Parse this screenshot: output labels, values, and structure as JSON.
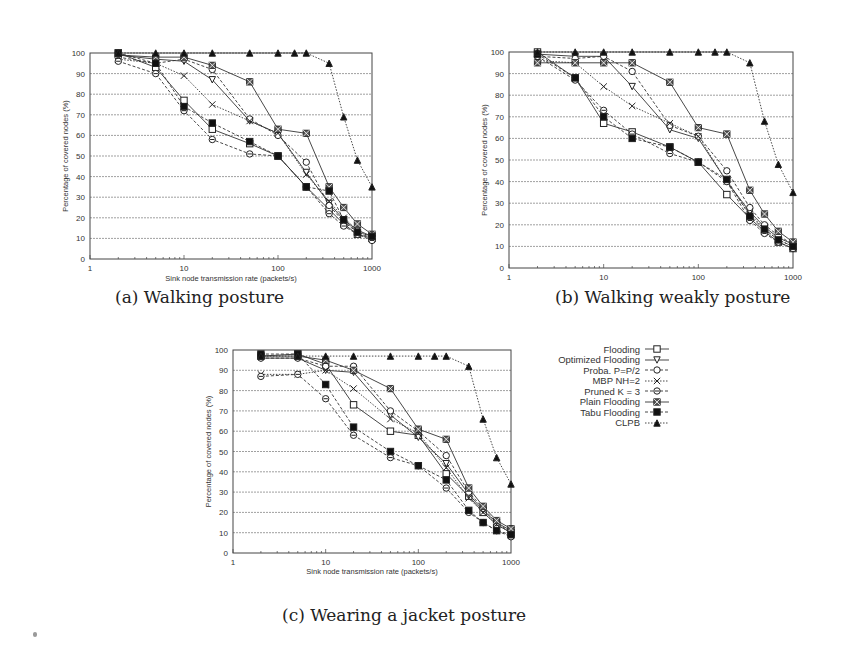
{
  "figure": {
    "captions": {
      "a": "(a) Walking posture",
      "b": "(b) Walking weakly posture",
      "c": "(c) Wearing a jacket posture"
    },
    "legend": [
      {
        "label": "Flooding",
        "marker": "square-open",
        "line": "solid"
      },
      {
        "label": "Optimized Flooding",
        "marker": "triangle-down-open",
        "line": "solid"
      },
      {
        "label": "Proba. P=P/2",
        "marker": "circle-open",
        "line": "dashed"
      },
      {
        "label": "MBP NH=2",
        "marker": "x",
        "line": "dotted"
      },
      {
        "label": "Pruned K = 3",
        "marker": "circle-open-dot",
        "line": "dashed"
      },
      {
        "label": "Plain Flooding",
        "marker": "star-box",
        "line": "solid"
      },
      {
        "label": "Tabu Flooding",
        "marker": "square-filled",
        "line": "dashed"
      },
      {
        "label": "CLPB",
        "marker": "triangle-filled",
        "line": "dotted"
      }
    ]
  },
  "chart_data": [
    {
      "id": "a",
      "type": "line",
      "title": "(a) Walking posture",
      "xlabel": "Sink node transmission rate (packets/s)",
      "ylabel": "Percentage of covered nodes (%)",
      "xscale": "log",
      "xlim": [
        1,
        1000
      ],
      "ylim": [
        0,
        100
      ],
      "xticks": [
        "1",
        "10",
        "100",
        "1000"
      ],
      "yticks": [
        "0",
        "10",
        "20",
        "30",
        "40",
        "50",
        "60",
        "70",
        "80",
        "90",
        "100"
      ],
      "grid": "horizontal",
      "x": [
        2,
        5,
        10,
        20,
        50,
        100,
        200,
        350,
        500,
        700,
        1000
      ],
      "series": [
        {
          "name": "Flooding",
          "values": [
            100,
            93,
            77,
            63,
            56,
            50,
            35,
            24,
            17,
            12,
            10
          ]
        },
        {
          "name": "Optimized Flooding",
          "values": [
            99,
            97,
            96,
            87,
            67,
            61,
            42,
            27,
            19,
            14,
            11
          ]
        },
        {
          "name": "Proba. P=P/2",
          "values": [
            98,
            95,
            97,
            92,
            68,
            60,
            47,
            26,
            18,
            13,
            10
          ]
        },
        {
          "name": "MBP NH=2",
          "values": [
            97,
            95,
            89,
            75,
            67,
            61,
            41,
            28,
            20,
            14,
            10
          ]
        },
        {
          "name": "Pruned K = 3",
          "values": [
            96,
            90,
            72,
            58,
            51,
            50,
            35,
            22,
            16,
            12,
            9
          ]
        },
        {
          "name": "Plain Flooding",
          "values": [
            99,
            98,
            98,
            94,
            86,
            63,
            61,
            35,
            25,
            17,
            12
          ]
        },
        {
          "name": "Tabu Flooding",
          "values": [
            100,
            95,
            74,
            66,
            57,
            50,
            35,
            33,
            19,
            13,
            11
          ]
        },
        {
          "name": "CLPB",
          "x": [
            2,
            5,
            10,
            20,
            50,
            100,
            150,
            200,
            350,
            500,
            700,
            1000
          ],
          "values": [
            100,
            100,
            100,
            100,
            100,
            100,
            100,
            100,
            95,
            69,
            48,
            35
          ]
        }
      ]
    },
    {
      "id": "b",
      "type": "line",
      "title": "(b) Walking weakly posture",
      "xlabel": "",
      "ylabel": "Percentage of covered nodes (%)",
      "xscale": "log",
      "xlim": [
        1,
        1000
      ],
      "ylim": [
        0,
        100
      ],
      "xticks": [
        "1",
        "10",
        "100",
        "1000"
      ],
      "yticks": [
        "0",
        "10",
        "20",
        "30",
        "40",
        "50",
        "60",
        "70",
        "80",
        "90",
        "100"
      ],
      "grid": "horizontal",
      "x": [
        2,
        5,
        10,
        20,
        50,
        100,
        200,
        350,
        500,
        700,
        1000
      ],
      "series": [
        {
          "name": "Flooding",
          "values": [
            100,
            88,
            67,
            63,
            56,
            49,
            34,
            23,
            17,
            12,
            9
          ]
        },
        {
          "name": "Optimized Flooding",
          "values": [
            99,
            98,
            98,
            84,
            64,
            60,
            40,
            26,
            19,
            14,
            11
          ]
        },
        {
          "name": "Proba. P=P/2",
          "values": [
            98,
            97,
            98,
            91,
            66,
            61,
            45,
            28,
            20,
            15,
            11
          ]
        },
        {
          "name": "MBP NH=2",
          "values": [
            96,
            95,
            84,
            75,
            67,
            61,
            40,
            25,
            18,
            13,
            10
          ]
        },
        {
          "name": "Pruned K = 3",
          "values": [
            98,
            87,
            73,
            62,
            53,
            49,
            40,
            22,
            16,
            12,
            9
          ]
        },
        {
          "name": "Plain Flooding",
          "values": [
            95,
            95,
            95,
            95,
            86,
            65,
            62,
            36,
            25,
            17,
            12
          ]
        },
        {
          "name": "Tabu Flooding",
          "values": [
            99,
            88,
            70,
            60,
            56,
            49,
            41,
            24,
            18,
            13,
            10
          ]
        },
        {
          "name": "CLPB",
          "x": [
            2,
            5,
            10,
            20,
            50,
            100,
            150,
            200,
            350,
            500,
            700,
            1000
          ],
          "values": [
            100,
            100,
            100,
            100,
            100,
            100,
            100,
            100,
            95,
            68,
            48,
            35
          ]
        }
      ]
    },
    {
      "id": "c",
      "type": "line",
      "title": "(c) Wearing a jacket posture",
      "xlabel": "Sink node transmission rate (packets/s)",
      "ylabel": "Percentage of covered nodes (%)",
      "xscale": "log",
      "xlim": [
        1,
        1000
      ],
      "ylim": [
        0,
        100
      ],
      "xticks": [
        "1",
        "10",
        "100",
        "1000"
      ],
      "yticks": [
        "0",
        "10",
        "20",
        "30",
        "40",
        "50",
        "60",
        "70",
        "80",
        "90",
        "100"
      ],
      "grid": "horizontal",
      "x": [
        2,
        5,
        10,
        20,
        50,
        100,
        200,
        350,
        500,
        700,
        1000
      ],
      "series": [
        {
          "name": "Flooding",
          "values": [
            97,
            98,
            93,
            73,
            60,
            58,
            39,
            28,
            20,
            14,
            10
          ]
        },
        {
          "name": "Optimized Flooding",
          "values": [
            96,
            96,
            90,
            89,
            68,
            57,
            44,
            29,
            21,
            15,
            11
          ]
        },
        {
          "name": "Proba. P=P/2",
          "values": [
            96,
            96,
            92,
            92,
            70,
            60,
            48,
            30,
            22,
            15,
            10
          ]
        },
        {
          "name": "MBP NH=2",
          "values": [
            88,
            88,
            90,
            81,
            66,
            59,
            42,
            27,
            20,
            14,
            10
          ]
        },
        {
          "name": "Pruned K = 3",
          "values": [
            87,
            88,
            76,
            58,
            47,
            43,
            32,
            20,
            15,
            11,
            8
          ]
        },
        {
          "name": "Plain Flooding",
          "values": [
            97,
            97,
            95,
            90,
            81,
            61,
            56,
            32,
            23,
            16,
            12
          ]
        },
        {
          "name": "Tabu Flooding",
          "values": [
            98,
            98,
            83,
            62,
            50,
            43,
            36,
            21,
            15,
            11,
            9
          ]
        },
        {
          "name": "CLPB",
          "x": [
            2,
            5,
            10,
            20,
            50,
            100,
            150,
            200,
            350,
            500,
            700,
            1000
          ],
          "values": [
            97,
            97,
            97,
            97,
            97,
            97,
            97,
            97,
            92,
            66,
            47,
            34
          ]
        }
      ]
    }
  ]
}
